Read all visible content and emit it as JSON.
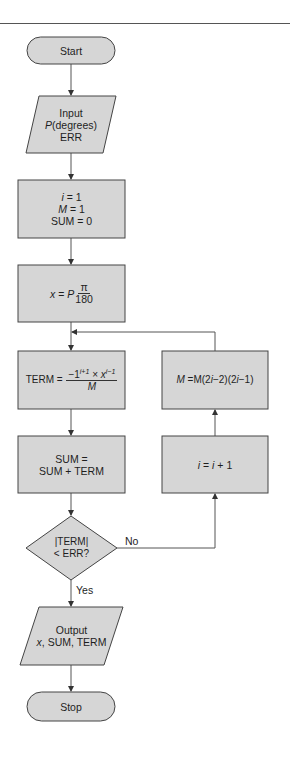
{
  "diagram": {
    "type": "flowchart",
    "colors": {
      "fill": "#d6d6d6",
      "stroke": "#444444",
      "line": "#555555",
      "text": "#1e1e1e"
    },
    "nodes": {
      "start": {
        "shape": "terminal",
        "label": "Start"
      },
      "input": {
        "shape": "parallelogram",
        "lines": [
          "Input",
          "P",
          "(degrees)",
          "ERR"
        ]
      },
      "init": {
        "shape": "process",
        "lines": [
          "i",
          " = 1",
          "M",
          " = 1",
          "SUM = 0"
        ]
      },
      "convert": {
        "shape": "process",
        "lhs": "x",
        "eq": " = ",
        "p": "P",
        "num": "π",
        "den": "180"
      },
      "term": {
        "shape": "process",
        "lhs": "TERM = ",
        "num_a": "−1",
        "sup_a": "i+1",
        "times": " × ",
        "num_b": "x",
        "sup_b": "i−1",
        "den": "M"
      },
      "sum": {
        "shape": "process",
        "lines": [
          "SUM =",
          "SUM + TERM"
        ]
      },
      "decision": {
        "shape": "decision",
        "lines": [
          "|TERM|",
          "< ERR?"
        ]
      },
      "output": {
        "shape": "parallelogram",
        "lines": [
          "Output",
          "x",
          ", SUM, TERM"
        ]
      },
      "stop": {
        "shape": "terminal",
        "label": "Stop"
      },
      "increment": {
        "shape": "process",
        "a": "i",
        "b": " = ",
        "c": "i",
        "d": " + 1"
      },
      "update_m": {
        "shape": "process",
        "a": "M",
        "b": " =M(2",
        "c": "i",
        "d": "−2)(2",
        "e": "i",
        "f": "−1)"
      }
    },
    "edges": [
      {
        "from": "start",
        "to": "input"
      },
      {
        "from": "input",
        "to": "init"
      },
      {
        "from": "init",
        "to": "convert"
      },
      {
        "from": "convert",
        "to": "term"
      },
      {
        "from": "term",
        "to": "sum"
      },
      {
        "from": "sum",
        "to": "decision"
      },
      {
        "from": "decision",
        "to": "output",
        "label": "Yes"
      },
      {
        "from": "decision",
        "to": "increment",
        "label": "No"
      },
      {
        "from": "increment",
        "to": "update_m"
      },
      {
        "from": "update_m",
        "to": "term"
      },
      {
        "from": "output",
        "to": "stop"
      }
    ],
    "edge_labels": {
      "yes": "Yes",
      "no": "No"
    }
  }
}
